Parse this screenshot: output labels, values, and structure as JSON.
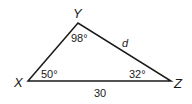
{
  "diagram": {
    "type": "triangle",
    "vertices": [
      {
        "name": "X",
        "label": "X",
        "x": 28,
        "y": 81
      },
      {
        "name": "Y",
        "label": "Y",
        "x": 78,
        "y": 23
      },
      {
        "name": "Z",
        "label": "Z",
        "x": 171,
        "y": 81
      }
    ],
    "angles": {
      "X": "50°",
      "Y": "98°",
      "Z": "32°"
    },
    "sides": {
      "XZ": "30",
      "YZ": "d"
    },
    "stroke_color": "#1a1a1a"
  }
}
